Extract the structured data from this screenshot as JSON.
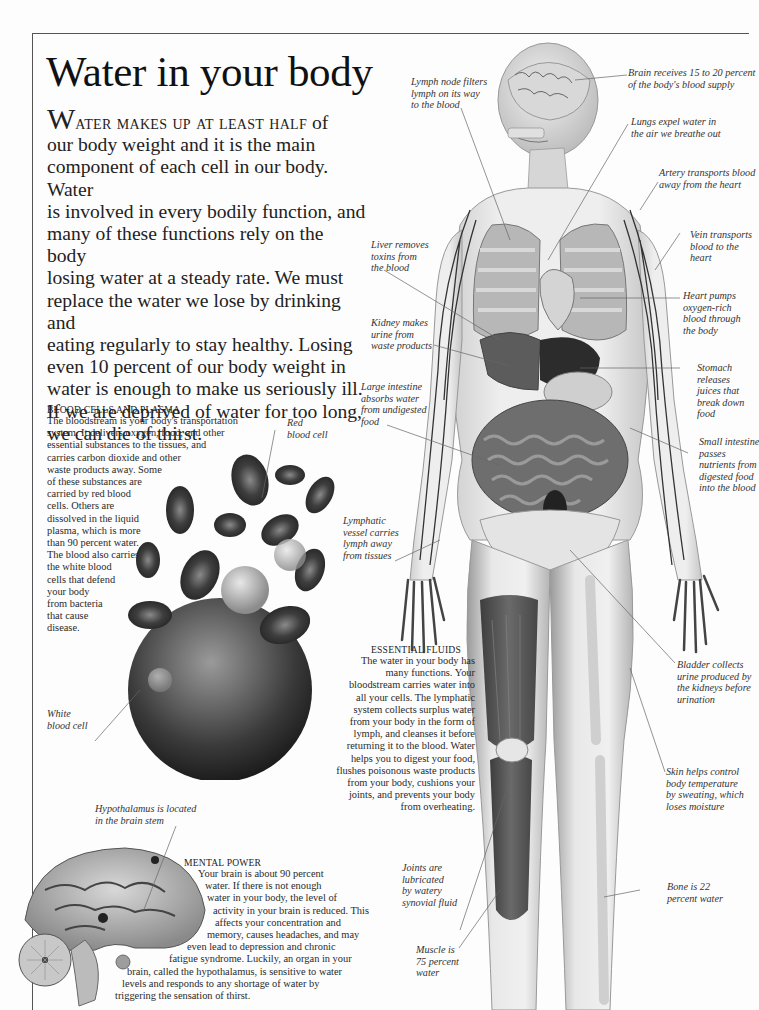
{
  "page": {
    "title": "Water in your body",
    "intro": {
      "dropcap": "W",
      "smallcaps": "ater makes up at least half",
      "lines": [
        " of",
        "our body weight and it is the main",
        "component of each cell in our body. Water",
        "is involved in every bodily function, and",
        "many of these functions rely on the body",
        "losing water at a steady rate. We must",
        "replace the water we lose by drinking and",
        "eating regularly to stay healthy. Losing",
        "even 10 percent of our body weight in",
        "water is enough to make us seriously ill.",
        "If we are deprived of water for too long,",
        "we can die of thirst."
      ]
    }
  },
  "sections": {
    "blood": {
      "heading": "Blood cells and plasma",
      "lines": [
        "The bloodstream is your body's transportation",
        "system. It delivers oxygen, food, and other",
        "essential substances to the tissues, and",
        "carries carbon dioxide and other",
        "waste products away. Some",
        "of these substances are",
        "carried by red blood",
        "cells. Others are",
        "dissolved in the liquid",
        "plasma, which is more",
        "than 90 percent water.",
        "The blood also carries",
        "the white blood",
        "cells that defend",
        "your body",
        "from bacteria",
        "that cause",
        "disease."
      ]
    },
    "fluids": {
      "heading": "Essential fluids",
      "lines": [
        "The water in your body has",
        "many functions. Your",
        "bloodstream carries water into",
        "all your cells. The lymphatic",
        "system collects surplus water",
        "from your body in the form of",
        "lymph, and cleanses it before",
        "returning it to the blood. Water",
        "helps you to digest your food,",
        "flushes poisonous waste products",
        "from your body, cushions your",
        "joints, and prevents your body",
        "from overheating."
      ]
    },
    "mental": {
      "heading": "Mental power",
      "lines": [
        "Your brain is about 90 percent",
        "water. If there is not enough",
        "water in your body, the level of",
        "activity in your brain is reduced. This",
        "affects your concentration and",
        "memory, causes headaches, and may",
        "even lead to depression and chronic",
        "fatigue syndrome. Luckily, an organ in your",
        "brain, called the hypothalamus, is sensitive to water",
        "levels and responds to any shortage of water by",
        "triggering the sensation of thirst."
      ]
    }
  },
  "labels": {
    "red_cell": [
      "Red",
      "blood cell"
    ],
    "white_cell": [
      "White",
      "blood cell"
    ],
    "hypothalamus": [
      "Hypothalamus is located",
      "in the brain stem"
    ],
    "lymph_node": [
      "Lymph node filters",
      "lymph on its way",
      "to the blood"
    ],
    "brain": [
      "Brain receives 15 to 20 percent",
      "of the body's blood supply"
    ],
    "lungs": [
      "Lungs expel water in",
      "the air we breathe out"
    ],
    "artery": [
      "Artery transports blood",
      "away from the heart"
    ],
    "vein": [
      "Vein transports",
      "blood to the",
      "heart"
    ],
    "liver": [
      "Liver removes",
      "toxins from",
      "the blood"
    ],
    "heart": [
      "Heart pumps",
      "oxygen-rich",
      "blood through",
      "the body"
    ],
    "kidney": [
      "Kidney makes",
      "urine from",
      "waste products"
    ],
    "stomach": [
      "Stomach",
      "releases",
      "juices that",
      "break down",
      "food"
    ],
    "large_intestine": [
      "Large intestine",
      "absorbs water",
      "from undigested",
      "food"
    ],
    "small_intestine": [
      "Small intestine",
      "passes",
      "nutrients from",
      "digested food",
      "into the blood"
    ],
    "lymphatic": [
      "Lymphatic",
      "vessel carries",
      "lymph away",
      "from tissues"
    ],
    "bladder": [
      "Bladder collects",
      "urine produced by",
      "the kidneys before",
      "urination"
    ],
    "skin": [
      "Skin helps control",
      "body temperature",
      "by sweating, which",
      "loses moisture"
    ],
    "joints": [
      "Joints are",
      "lubricated",
      "by watery",
      "synovial fluid"
    ],
    "bone": [
      "Bone is 22",
      "percent water"
    ],
    "muscle": [
      "Muscle is",
      "75 percent",
      "water"
    ]
  },
  "colors": {
    "frame": "#555555",
    "text": "#222222",
    "label": "#333333",
    "leader": "#666666"
  }
}
